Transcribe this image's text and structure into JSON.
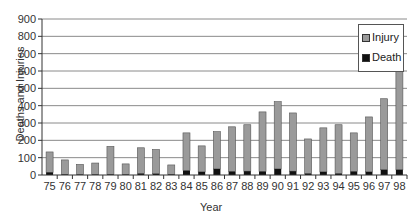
{
  "chart_data": {
    "type": "bar",
    "stacked": true,
    "title": "",
    "xlabel": "Year",
    "ylabel": "Deaths and Injuries",
    "ylim": [
      0,
      900
    ],
    "yticks": [
      0,
      100,
      200,
      300,
      400,
      500,
      600,
      700,
      800,
      900
    ],
    "grid": true,
    "legend_position": "top-right",
    "categories": [
      "75",
      "76",
      "77",
      "78",
      "79",
      "80",
      "81",
      "82",
      "83",
      "84",
      "85",
      "86",
      "87",
      "88",
      "89",
      "90",
      "91",
      "92",
      "93",
      "94",
      "95",
      "96",
      "97",
      "98"
    ],
    "series": [
      {
        "name": "Death",
        "color": "#111111",
        "values": [
          15,
          3,
          2,
          2,
          3,
          2,
          8,
          7,
          3,
          25,
          18,
          35,
          20,
          22,
          20,
          35,
          22,
          8,
          18,
          8,
          20,
          18,
          30,
          30
        ]
      },
      {
        "name": "Injury",
        "color": "#9a9a9a",
        "values": [
          118,
          84,
          59,
          67,
          162,
          62,
          149,
          140,
          55,
          218,
          150,
          215,
          258,
          268,
          344,
          388,
          336,
          200,
          254,
          282,
          223,
          317,
          410,
          810
        ]
      }
    ],
    "totals": [
      133,
      87,
      61,
      69,
      165,
      64,
      157,
      147,
      58,
      243,
      168,
      250,
      278,
      290,
      364,
      423,
      358,
      208,
      272,
      290,
      243,
      335,
      440,
      840
    ]
  },
  "legend": {
    "items": [
      {
        "label": "Injury",
        "color": "#9a9a9a"
      },
      {
        "label": "Death",
        "color": "#111111"
      }
    ]
  }
}
